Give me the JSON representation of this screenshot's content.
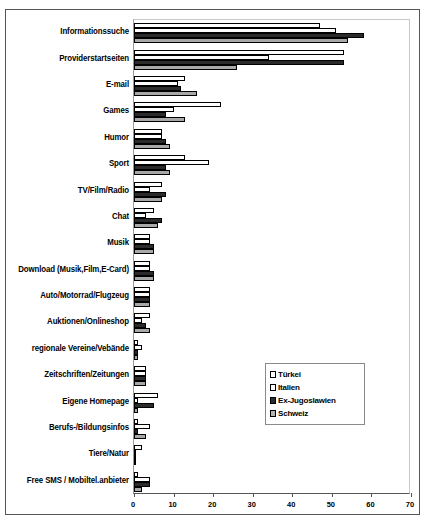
{
  "chart_data": {
    "type": "bar",
    "orientation": "horizontal",
    "title": "",
    "xlabel": "",
    "ylabel": "",
    "xlim": [
      0,
      70
    ],
    "xticks": [
      0,
      10,
      20,
      30,
      40,
      50,
      60,
      70
    ],
    "grid": false,
    "legend_position": "center-right",
    "categories": [
      "Informationssuche",
      "Providerstartseiten",
      "E-mail",
      "Games",
      "Humor",
      "Sport",
      "TV/Film/Radio",
      "Chat",
      "Musik",
      "Download (Musik,Film,E-Card)",
      "Auto/Motorrad/Flugzeug",
      "Auktionen/Onlineshop",
      "regionale Vereine/Vebände",
      "Zeitschriften/Zeitungen",
      "Eigene Homepage",
      "Berufs-/Bildungsinfos",
      "Tiere/Natur",
      "Free SMS / Mobiltel.anbieter"
    ],
    "series": [
      {
        "name": "Türkei",
        "color": "#ffffff",
        "values": [
          47,
          53,
          13,
          22,
          7,
          13,
          7,
          5,
          4,
          4,
          4,
          4,
          1,
          3,
          6,
          1,
          2,
          1
        ]
      },
      {
        "name": "Italien",
        "color": "#ffffff",
        "values": [
          51,
          34,
          11,
          10,
          7,
          19,
          4,
          3,
          4,
          4,
          4,
          2,
          2,
          3,
          1,
          4,
          0.4,
          4
        ]
      },
      {
        "name": "Ex-Jugoslawien",
        "color": "#2b2b2b",
        "values": [
          58,
          53,
          12,
          8,
          8,
          8,
          8,
          7,
          5,
          5,
          4,
          3,
          1,
          3,
          5,
          1,
          0.4,
          4
        ]
      },
      {
        "name": "Schweiz",
        "color": "#a8a8a8",
        "values": [
          54,
          26,
          16,
          13,
          9,
          9,
          7,
          6,
          5,
          5,
          4,
          4,
          1,
          3,
          1,
          3,
          0.4,
          2
        ]
      }
    ]
  },
  "legend": {
    "entries": [
      {
        "label": "Türkei"
      },
      {
        "label": "Italien"
      },
      {
        "label": "Ex-Jugoslawien"
      },
      {
        "label": "Schweiz"
      }
    ]
  },
  "axis": {
    "tick_labels": [
      "0",
      "10",
      "20",
      "30",
      "40",
      "50",
      "60",
      "70"
    ]
  }
}
